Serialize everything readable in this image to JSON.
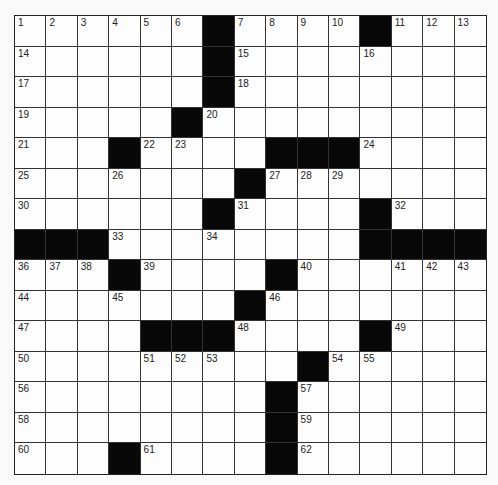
{
  "puzzle": {
    "rows": 15,
    "cols": 15,
    "grid": [
      "......#....#...",
      "......#........",
      "......#........",
      ".....#.........",
      "...#....###....",
      ".......#.......",
      "......#....#...",
      "###........####",
      "...#....#......",
      ".......#.......",
      "....###....#...",
      ".........#.....",
      "........#......",
      "........#......",
      "...#....#......"
    ],
    "numbers": {
      "0,0": "1",
      "0,1": "2",
      "0,2": "3",
      "0,3": "4",
      "0,4": "5",
      "0,5": "6",
      "0,7": "7",
      "0,8": "8",
      "0,9": "9",
      "0,10": "10",
      "0,12": "11",
      "0,13": "12",
      "0,14": "13",
      "1,0": "14",
      "1,7": "15",
      "1,11": "16",
      "2,0": "17",
      "2,7": "18",
      "3,0": "19",
      "3,6": "20",
      "4,0": "21",
      "4,4": "22",
      "4,5": "23",
      "4,11": "24",
      "5,0": "25",
      "5,3": "26",
      "5,8": "27",
      "5,9": "28",
      "5,10": "29",
      "6,0": "30",
      "6,7": "31",
      "6,12": "32",
      "7,3": "33",
      "7,6": "34",
      "7,11": "35",
      "8,0": "36",
      "8,1": "37",
      "8,2": "38",
      "8,4": "39",
      "8,9": "40",
      "8,12": "41",
      "8,13": "42",
      "8,14": "43",
      "9,0": "44",
      "9,3": "45",
      "9,8": "46",
      "10,0": "47",
      "10,7": "48",
      "10,12": "49",
      "11,0": "50",
      "11,4": "51",
      "11,5": "52",
      "11,6": "53",
      "11,10": "54",
      "11,11": "55",
      "12,0": "56",
      "12,9": "57",
      "13,0": "58",
      "13,9": "59",
      "14,0": "60",
      "14,4": "61",
      "14,9": "62"
    }
  }
}
